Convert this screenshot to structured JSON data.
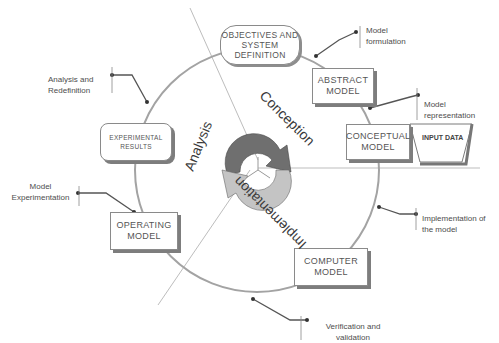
{
  "diagram": {
    "nodes": {
      "objectives": "OBJECTIVES AND SYSTEM DEFINITION",
      "abstract": "ABSTRACT MODEL",
      "conceptual": "CONCEPTUAL MODEL",
      "input": "INPUT DATA",
      "computer": "COMPUTER MODEL",
      "operating": "OPERATING MODEL",
      "experimental": "EXPERIMENTAL RESULTS"
    },
    "notes": {
      "formulation": "Model formulation",
      "representation": "Model representation",
      "implementation": "Implementation of the model",
      "verification": "Verification and validation",
      "experimentation": "Model Experimentation",
      "analysis": "Analysis and Redefinition"
    },
    "phases": {
      "conception": "Conception",
      "implementation": "Implementation",
      "analysis": "Analysis"
    },
    "colors": {
      "arrow_dark": "#6f6f6f",
      "arrow_light": "#c4c4c4",
      "circle": "#9a9a9a",
      "box_border": "#8a8a8a",
      "text": "#555555"
    }
  }
}
